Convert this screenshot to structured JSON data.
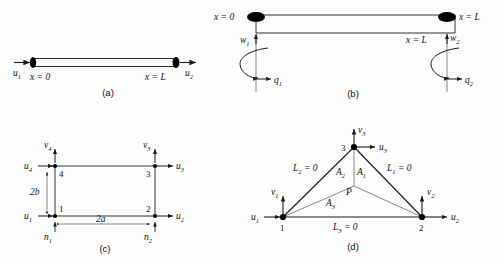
{
  "figure": {
    "panels": [
      {
        "id": "a",
        "caption": "(a)",
        "title": "bar-element",
        "labels": {
          "u1": "u",
          "u1_sub": "1",
          "u2": "u",
          "u2_sub": "2",
          "x0": "x = 0",
          "xL": "x = L"
        }
      },
      {
        "id": "b",
        "caption": "(b)",
        "title": "torsion-shaft-element",
        "labels": {
          "x0": "x = 0",
          "xL_top": "x = L",
          "xL_bottom": "x = L",
          "w1": "w",
          "w1_sub": "1",
          "w2": "w",
          "w2_sub": "2",
          "q1": "q",
          "q1_sub": "1",
          "q2": "q",
          "q2_sub": "2"
        }
      },
      {
        "id": "c",
        "caption": "(c)",
        "title": "rectangular-four-node-element",
        "labels": {
          "n1_num": "1",
          "n2_num": "2",
          "n3_num": "3",
          "n4_num": "4",
          "u1": "u",
          "u1_sub": "1",
          "u2": "u",
          "u2_sub": "2",
          "u3": "u",
          "u3_sub": "3",
          "u4": "u",
          "u4_sub": "4",
          "v3": "v",
          "v3_sub": "3",
          "v4": "v",
          "v4_sub": "4",
          "dim_width": "2a",
          "dim_height": "2b",
          "n1_norm": "n",
          "n1_norm_sub": "1",
          "n2_norm": "n",
          "n2_norm_sub": "2"
        }
      },
      {
        "id": "d",
        "caption": "(d)",
        "title": "triangular-area-coordinate-element",
        "labels": {
          "n1_num": "1",
          "n2_num": "2",
          "n3_num": "3",
          "u1": "u",
          "u1_sub": "1",
          "u2": "u",
          "u2_sub": "2",
          "u3": "u",
          "u3_sub": "3",
          "v1": "v",
          "v1_sub": "1",
          "v2": "v",
          "v2_sub": "2",
          "v3": "v",
          "v3_sub": "3",
          "L1": "L",
          "L1_sub": "1",
          "L1_eq": " = 0",
          "L2": "L",
          "L2_sub": "2",
          "L2_eq": " = 0",
          "L3": "L",
          "L3_sub": "3",
          "L3_eq": " = 0",
          "A1": "A",
          "A1_sub": "1",
          "A2": "A",
          "A2_sub": "2",
          "A3": "A",
          "A3_sub": "3",
          "point_p": "P"
        }
      }
    ]
  },
  "colors": {
    "ink": "#111111",
    "line": "#1a1a1a",
    "thin_line": "#555555",
    "node_fill": "#000000",
    "background": "#fdfdfd"
  }
}
